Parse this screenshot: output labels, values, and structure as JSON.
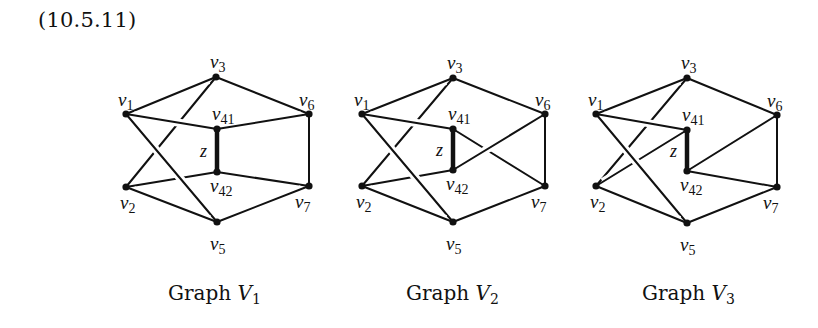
{
  "equation_number": "(10.5.11)",
  "edge_label": "z",
  "graphs": [
    {
      "name": "Graph V1",
      "caption_word": "Graph",
      "caption_var": "V",
      "caption_sub": "1",
      "vertices": {
        "v1": {
          "x": 126,
          "y": 114,
          "label": "v",
          "sub": "1"
        },
        "v3": {
          "x": 216,
          "y": 77,
          "label": "v",
          "sub": "3"
        },
        "v41": {
          "x": 217,
          "y": 129,
          "label": "v",
          "sub": "41"
        },
        "v6": {
          "x": 309,
          "y": 114,
          "label": "v",
          "sub": "6"
        },
        "v42": {
          "x": 217,
          "y": 172,
          "label": "v",
          "sub": "42"
        },
        "v2": {
          "x": 126,
          "y": 187,
          "label": "v",
          "sub": "2"
        },
        "v7": {
          "x": 309,
          "y": 186,
          "label": "v",
          "sub": "7"
        },
        "v5": {
          "x": 217,
          "y": 222,
          "label": "v",
          "sub": "5"
        }
      },
      "edges": [
        [
          "v3",
          "v2"
        ],
        [
          "v2",
          "v42"
        ],
        [
          "v1",
          "v3"
        ],
        [
          "v1",
          "v41"
        ],
        [
          "v1",
          "v5"
        ],
        [
          "v3",
          "v6"
        ],
        [
          "v41",
          "v6"
        ],
        [
          "v42",
          "v7"
        ],
        [
          "v6",
          "v7"
        ],
        [
          "v2",
          "v5"
        ],
        [
          "v5",
          "v7"
        ]
      ],
      "z_edge": [
        "v41",
        "v42"
      ]
    },
    {
      "name": "Graph V2",
      "caption_word": "Graph",
      "caption_var": "V",
      "caption_sub": "2",
      "vertices": {
        "v1": {
          "x": 362,
          "y": 114,
          "label": "v",
          "sub": "1"
        },
        "v3": {
          "x": 453,
          "y": 78,
          "label": "v",
          "sub": "3"
        },
        "v41": {
          "x": 453,
          "y": 129,
          "label": "v",
          "sub": "41"
        },
        "v6": {
          "x": 545,
          "y": 114,
          "label": "v",
          "sub": "6"
        },
        "v42": {
          "x": 453,
          "y": 170,
          "label": "v",
          "sub": "42"
        },
        "v2": {
          "x": 362,
          "y": 186,
          "label": "v",
          "sub": "2"
        },
        "v7": {
          "x": 545,
          "y": 186,
          "label": "v",
          "sub": "7"
        },
        "v5": {
          "x": 453,
          "y": 222,
          "label": "v",
          "sub": "5"
        }
      },
      "edges": [
        [
          "v3",
          "v2"
        ],
        [
          "v2",
          "v42"
        ],
        [
          "v41",
          "v7"
        ],
        [
          "v1",
          "v3"
        ],
        [
          "v1",
          "v41"
        ],
        [
          "v1",
          "v5"
        ],
        [
          "v3",
          "v6"
        ],
        [
          "v42",
          "v6"
        ],
        [
          "v6",
          "v7"
        ],
        [
          "v2",
          "v5"
        ],
        [
          "v5",
          "v7"
        ]
      ],
      "z_edge": [
        "v41",
        "v42"
      ]
    },
    {
      "name": "Graph V3",
      "caption_word": "Graph",
      "caption_var": "V",
      "caption_sub": "3",
      "vertices": {
        "v1": {
          "x": 596,
          "y": 114,
          "label": "v",
          "sub": "1"
        },
        "v3": {
          "x": 687,
          "y": 78,
          "label": "v",
          "sub": "3"
        },
        "v41": {
          "x": 687,
          "y": 130,
          "label": "v",
          "sub": "41"
        },
        "v6": {
          "x": 777,
          "y": 115,
          "label": "v",
          "sub": "6"
        },
        "v42": {
          "x": 687,
          "y": 171,
          "label": "v",
          "sub": "42"
        },
        "v2": {
          "x": 596,
          "y": 186,
          "label": "v",
          "sub": "2"
        },
        "v7": {
          "x": 777,
          "y": 187,
          "label": "v",
          "sub": "7"
        },
        "v5": {
          "x": 687,
          "y": 223,
          "label": "v",
          "sub": "5"
        }
      },
      "edges": [
        [
          "v3",
          "v2"
        ],
        [
          "v41",
          "v2"
        ],
        [
          "v1",
          "v3"
        ],
        [
          "v1",
          "v41"
        ],
        [
          "v1",
          "v5"
        ],
        [
          "v3",
          "v6"
        ],
        [
          "v42",
          "v6"
        ],
        [
          "v42",
          "v7"
        ],
        [
          "v6",
          "v7"
        ],
        [
          "v2",
          "v5"
        ],
        [
          "v5",
          "v7"
        ]
      ],
      "z_edge": [
        "v41",
        "v42"
      ]
    }
  ]
}
